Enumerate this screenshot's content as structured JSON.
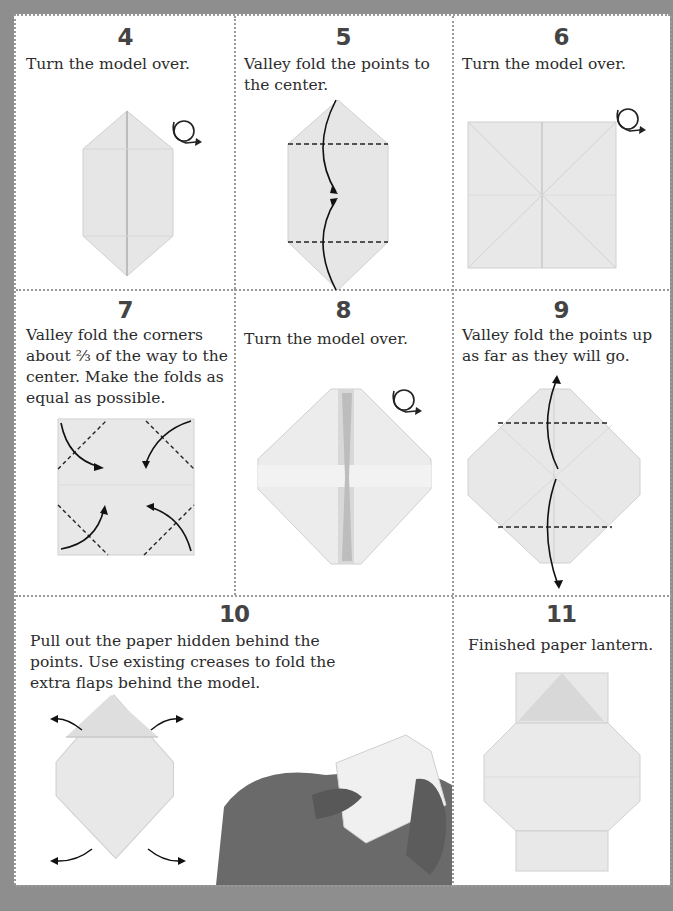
{
  "document": {
    "title": "Paper lantern origami instructions (steps 4-11)",
    "colors": {
      "background_border": "#8e8e8e",
      "page": "#ffffff",
      "divider": "#9a9a9a",
      "text": "#2c2c2c",
      "paper": "#e8e8e8"
    }
  },
  "steps": [
    {
      "number": "4",
      "text": "Turn the model over.",
      "icon": "turn-over-icon"
    },
    {
      "number": "5",
      "text": "Valley fold the points to the center.",
      "icon": "fold-arrows"
    },
    {
      "number": "6",
      "text": "Turn the model over.",
      "icon": "turn-over-icon"
    },
    {
      "number": "7",
      "text": "Valley fold the corners about ⅔ of the way to the center. Make the folds as equal as possible.",
      "icon": "fold-arrows"
    },
    {
      "number": "8",
      "text": "Turn the model over.",
      "icon": "turn-over-icon"
    },
    {
      "number": "9",
      "text": "Valley fold the points up as far as they will go.",
      "icon": "fold-arrows"
    },
    {
      "number": "10",
      "text": "Pull out the paper hidden behind the points. Use existing creases to fold the extra flaps behind the model.",
      "icon": "pull-out-arrows"
    },
    {
      "number": "11",
      "text": "Finished paper lantern.",
      "icon": "none"
    }
  ]
}
